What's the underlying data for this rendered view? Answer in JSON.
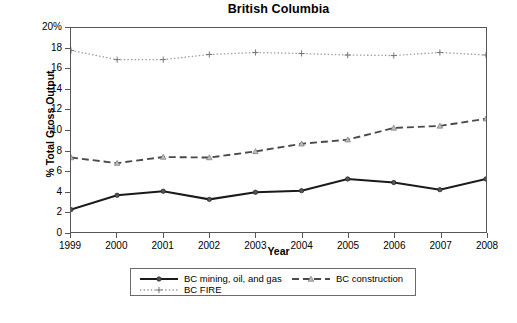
{
  "chart_data": {
    "type": "line",
    "title": "British Columbia",
    "xlabel": "Year",
    "ylabel": "% Total Gross Output",
    "grid": false,
    "legend_position": "bottom",
    "x": [
      1999,
      2000,
      2001,
      2002,
      2003,
      2004,
      2005,
      2006,
      2007,
      2008
    ],
    "categories": [
      "1999",
      "2000",
      "2001",
      "2002",
      "2003",
      "2004",
      "2005",
      "2006",
      "2007",
      "2008"
    ],
    "xlim": [
      1999,
      2008
    ],
    "ylim": [
      0,
      20
    ],
    "ytick_labels": [
      "0",
      "2",
      "4",
      "6",
      "8",
      "10",
      "12",
      "14",
      "16",
      "18",
      "20%"
    ],
    "ytick_values": [
      0,
      2,
      4,
      6,
      8,
      10,
      12,
      14,
      16,
      18,
      20
    ],
    "series": [
      {
        "name": "BC mining, oil, and gas",
        "values": [
          2.2,
          3.6,
          4.0,
          3.2,
          3.9,
          4.05,
          5.2,
          4.85,
          4.15,
          5.2
        ],
        "color": "#1a1a1a",
        "style": "solid",
        "marker": "diamond"
      },
      {
        "name": "BC construction",
        "values": [
          7.3,
          6.75,
          7.35,
          7.3,
          7.9,
          8.65,
          9.05,
          10.2,
          10.4,
          11.1
        ],
        "color": "#4a4a4a",
        "style": "dashed",
        "marker": "triangle"
      },
      {
        "name": "BC FIRE",
        "values": [
          17.8,
          16.9,
          16.9,
          17.4,
          17.6,
          17.5,
          17.35,
          17.3,
          17.6,
          17.35
        ],
        "color": "#9a9a9a",
        "style": "dotted",
        "marker": "plus"
      }
    ]
  },
  "axis": {
    "frame_color": "#565656"
  }
}
